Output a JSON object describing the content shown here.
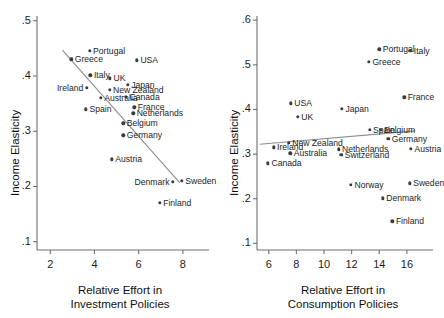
{
  "figure": {
    "background": "#ffffff",
    "point_color": "#3b3b3b",
    "fitline_color": "#8c8c8c",
    "axis_color": "#6e6e6e"
  },
  "chart_data": [
    {
      "type": "scatter",
      "panel": "left",
      "title": "",
      "xlabel": "Relative Effort in\nInvestment Policies",
      "xlabel_line1": "Relative Effort in",
      "xlabel_line2": "Investment Policies",
      "ylabel": "Income Elasticity",
      "xlim": [
        1.4,
        9.0
      ],
      "ylim": [
        0.085,
        0.505
      ],
      "xticks": [
        2,
        4,
        6,
        8
      ],
      "xticklabels": [
        "2",
        "4",
        "6",
        "8"
      ],
      "yticks": [
        0.1,
        0.2,
        0.3,
        0.4,
        0.5
      ],
      "yticklabels": [
        ".1",
        ".2",
        ".3",
        ".4",
        ".5"
      ],
      "grid": false,
      "legend": "none",
      "fit_line": {
        "x": [
          2.55,
          7.85
        ],
        "y": [
          0.447,
          0.207
        ]
      },
      "points": [
        {
          "label": "Portugal",
          "x": 3.78,
          "y": 0.4455,
          "side": "right"
        },
        {
          "label": "Greece",
          "x": 2.95,
          "y": 0.4305,
          "side": "right"
        },
        {
          "label": "USA",
          "x": 5.92,
          "y": 0.4285,
          "side": "right"
        },
        {
          "label": "Italy",
          "x": 3.82,
          "y": 0.4015,
          "side": "right"
        },
        {
          "label": "UK",
          "x": 4.7,
          "y": 0.3955,
          "side": "right"
        },
        {
          "label": "Japan",
          "x": 5.5,
          "y": 0.384,
          "side": "right"
        },
        {
          "label": "Ireland",
          "x": 3.65,
          "y": 0.379,
          "side": "left"
        },
        {
          "label": "New Zealand",
          "x": 4.68,
          "y": 0.3745,
          "side": "right"
        },
        {
          "label": "Canada",
          "x": 5.43,
          "y": 0.362,
          "side": "right"
        },
        {
          "label": "Australia",
          "x": 4.28,
          "y": 0.36,
          "side": "right"
        },
        {
          "label": "France",
          "x": 5.8,
          "y": 0.343,
          "side": "right"
        },
        {
          "label": "Spain",
          "x": 3.62,
          "y": 0.34,
          "side": "right"
        },
        {
          "label": "Netherlands",
          "x": 5.75,
          "y": 0.3325,
          "side": "right"
        },
        {
          "label": "Belgium",
          "x": 5.3,
          "y": 0.3145,
          "side": "right"
        },
        {
          "label": "Germany",
          "x": 5.3,
          "y": 0.2925,
          "side": "right"
        },
        {
          "label": "Austria",
          "x": 4.78,
          "y": 0.2495,
          "side": "right"
        },
        {
          "label": "Sweden",
          "x": 7.95,
          "y": 0.21,
          "side": "right"
        },
        {
          "label": "Denmark",
          "x": 7.55,
          "y": 0.208,
          "side": "left"
        },
        {
          "label": "Finland",
          "x": 6.95,
          "y": 0.1705,
          "side": "right"
        }
      ]
    },
    {
      "type": "scatter",
      "panel": "right",
      "title": "",
      "xlabel": "Relative Effort in\nConsumption Policies",
      "xlabel_line1": "Relative Effort in",
      "xlabel_line2": "Consumption Policies",
      "ylabel": "Income Elasticity",
      "xlim": [
        5.15,
        17.6
      ],
      "ylim": [
        0.085,
        0.605
      ],
      "xticks": [
        6,
        8,
        10,
        12,
        14,
        16
      ],
      "xticklabels": [
        "6",
        "8",
        "10",
        "12",
        "14",
        "16"
      ],
      "yticks": [
        0.1,
        0.2,
        0.3,
        0.4,
        0.5,
        0.6
      ],
      "yticklabels": [
        ".1",
        ".2",
        ".3",
        ".4",
        ".5",
        ".6"
      ],
      "grid": false,
      "legend": "none",
      "fit_line": {
        "x": [
          5.35,
          16.6
        ],
        "y": [
          0.322,
          0.352
        ]
      },
      "points": [
        {
          "label": "Portugal",
          "x": 14.0,
          "y": 0.535,
          "side": "right"
        },
        {
          "label": "Italy",
          "x": 16.25,
          "y": 0.531,
          "side": "right"
        },
        {
          "label": "Greece",
          "x": 13.25,
          "y": 0.5075,
          "side": "right"
        },
        {
          "label": "France",
          "x": 15.8,
          "y": 0.427,
          "side": "right"
        },
        {
          "label": "USA",
          "x": 7.6,
          "y": 0.414,
          "side": "right"
        },
        {
          "label": "Japan",
          "x": 11.3,
          "y": 0.4015,
          "side": "right"
        },
        {
          "label": "UK",
          "x": 8.1,
          "y": 0.383,
          "side": "right"
        },
        {
          "label": "Spain",
          "x": 13.3,
          "y": 0.354,
          "side": "right"
        },
        {
          "label": "Belgium",
          "x": 14.1,
          "y": 0.354,
          "side": "right"
        },
        {
          "label": "Germany",
          "x": 14.65,
          "y": 0.334,
          "side": "right"
        },
        {
          "label": "New Zealand",
          "x": 7.45,
          "y": 0.325,
          "side": "right"
        },
        {
          "label": "Ireland",
          "x": 6.35,
          "y": 0.315,
          "side": "right"
        },
        {
          "label": "Austria",
          "x": 16.3,
          "y": 0.312,
          "side": "right"
        },
        {
          "label": "Netherlands",
          "x": 11.05,
          "y": 0.3105,
          "side": "right"
        },
        {
          "label": "Australia",
          "x": 7.55,
          "y": 0.3015,
          "side": "right"
        },
        {
          "label": "Switzerland",
          "x": 11.25,
          "y": 0.299,
          "side": "right"
        },
        {
          "label": "Canada",
          "x": 5.95,
          "y": 0.279,
          "side": "right"
        },
        {
          "label": "Sweden",
          "x": 16.2,
          "y": 0.2345,
          "side": "right"
        },
        {
          "label": "Norway",
          "x": 11.95,
          "y": 0.2315,
          "side": "right"
        },
        {
          "label": "Denmark",
          "x": 14.25,
          "y": 0.201,
          "side": "right"
        },
        {
          "label": "Finland",
          "x": 14.95,
          "y": 0.149,
          "side": "right"
        }
      ]
    }
  ]
}
